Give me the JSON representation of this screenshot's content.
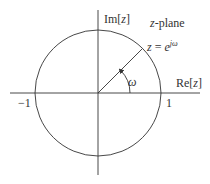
{
  "diagram": {
    "title": "z-plane",
    "axes": {
      "imag_label_prefix": "Im[",
      "imag_label_var": "z",
      "imag_label_suffix": "]",
      "real_label_prefix": "Re[",
      "real_label_var": "z",
      "real_label_suffix": "]"
    },
    "ticks": {
      "neg_one": "−1",
      "pos_one": "1"
    },
    "point_label": {
      "lhs": "z",
      "eq": " = ",
      "base": "e",
      "exponent": "jω"
    },
    "angle_label": "ω",
    "plane_label_var": "z",
    "plane_label_rest": "-plane",
    "geometry": {
      "center": [
        98,
        93
      ],
      "radius": 63,
      "angle_deg": 45
    },
    "colors": {
      "stroke": "#333333",
      "background": "#ffffff"
    }
  }
}
